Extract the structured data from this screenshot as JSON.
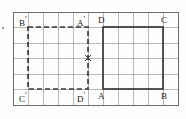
{
  "figure": {
    "canvas": {
      "width": 186,
      "height": 119,
      "background": "#fdfdfd"
    },
    "grid": {
      "x0": 13,
      "y0": 12,
      "x1": 178,
      "y1": 105,
      "columns": 11,
      "rows": 6,
      "cell_width": 15,
      "cell_height": 15.5,
      "line_color": "#9a9a9a",
      "line_width": 0.7,
      "border_color": "#6e6e6e",
      "border_width": 1.0
    },
    "shapes": [
      {
        "name": "dashed-rectangle",
        "style": "dashed",
        "stroke": "#3a3a3a",
        "stroke_width": 1.7,
        "dash": "5,3",
        "x": 28,
        "y": 27,
        "width": 60,
        "height": 62,
        "vertices": {
          "top_left": "B'",
          "top_right": "A'",
          "bottom_left": "C'",
          "bottom_right": "D'"
        }
      },
      {
        "name": "solid-rectangle",
        "style": "solid",
        "stroke": "#3a3a3a",
        "stroke_width": 1.7,
        "dash": "",
        "x": 103,
        "y": 27,
        "width": 60,
        "height": 62,
        "vertices": {
          "top_left": "D",
          "top_right": "C",
          "bottom_left": "A",
          "bottom_right": "B"
        }
      }
    ],
    "center_mark": {
      "name": "rotation-center-x",
      "x": 88,
      "y": 58,
      "size": 6,
      "stroke": "#3a3a3a",
      "stroke_width": 1.4
    },
    "labels": [
      {
        "id": "label-B-prime",
        "text": "B",
        "prime": "′",
        "x": 19,
        "y": 16
      },
      {
        "id": "label-A-prime",
        "text": "A",
        "prime": "′",
        "x": 77,
        "y": 16
      },
      {
        "id": "label-D",
        "text": "D",
        "prime": "",
        "x": 98,
        "y": 16
      },
      {
        "id": "label-C",
        "text": "C",
        "prime": "",
        "x": 161,
        "y": 16
      },
      {
        "id": "label-C-prime",
        "text": "C",
        "prime": "′",
        "x": 19,
        "y": 92
      },
      {
        "id": "label-D-prime",
        "text": "D",
        "prime": "′",
        "x": 77,
        "y": 92
      },
      {
        "id": "label-A",
        "text": "A",
        "prime": "",
        "x": 98,
        "y": 92
      },
      {
        "id": "label-B",
        "text": "B",
        "prime": "",
        "x": 161,
        "y": 92
      }
    ],
    "speck": {
      "x": 2,
      "y": 27
    }
  }
}
